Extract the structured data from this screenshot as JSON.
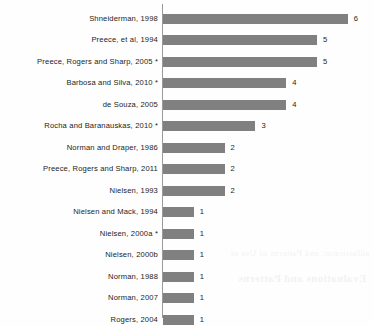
{
  "chart_data": {
    "type": "bar",
    "orientation": "horizontal",
    "title": "",
    "subtitle": "",
    "xlabel": "",
    "ylabel": "",
    "xlim": [
      0,
      6
    ],
    "grid": false,
    "legend": null,
    "bar_color": "#808080",
    "axis_color": "#9a9a9a",
    "text_color": "#1c1c1c",
    "show_value_labels": true,
    "note": "* marks entries flagged with an asterisk in the source figure",
    "categories": [
      "Shneiderman, 1998",
      "Preece, et al, 1994",
      "Preece,  Rogers and Sharp, 2005 *",
      "Barbosa and Silva, 2010 *",
      "de Souza, 2005",
      "Rocha and Baranauskas, 2010 *",
      "Norman and Draper, 1986",
      "Preece,  Rogers and Sharp, 2011",
      "Nielsen, 1993",
      "Nielsen and Mack, 1994",
      "Nielsen, 2000a *",
      "Nielsen, 2000b",
      "Norman, 1988",
      "Norman, 2007",
      "Rogers, 2004"
    ],
    "values": [
      6,
      5,
      5,
      4,
      4,
      3,
      2,
      2,
      2,
      1,
      1,
      1,
      1,
      1,
      1
    ],
    "value_labels": [
      "6",
      "5",
      "5",
      "4",
      "4",
      "3",
      "2",
      "2",
      "2",
      "1",
      "1",
      "1",
      "1",
      "1",
      "1"
    ]
  },
  "bleed_text": [
    "adlustirator, and Patterns of Use of",
    "Evaluations and Patterns"
  ]
}
